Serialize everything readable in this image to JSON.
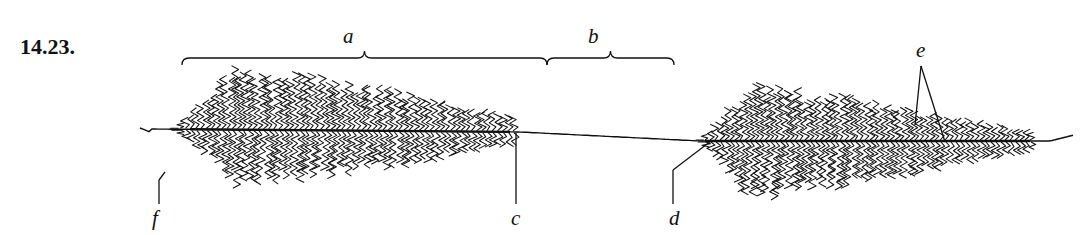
{
  "figure": {
    "number": "14.23.",
    "labels": {
      "a": "a",
      "b": "b",
      "c": "c",
      "d": "d",
      "e": "e",
      "f": "f"
    },
    "colors": {
      "ink": "#111111",
      "background": "#ffffff"
    }
  },
  "layout": {
    "axis": {
      "y_left": 129,
      "y_right": 141
    },
    "left_fiber": {
      "x_start": 175,
      "x_end": 515,
      "max_up": 70,
      "max_down": 60,
      "spacing": 5.2
    },
    "right_fiber": {
      "x_start": 700,
      "x_end": 1030,
      "max_up": 62,
      "max_down": 62,
      "spacing": 5.0
    },
    "brace_a": {
      "x1": 182,
      "x2": 547,
      "y": 58
    },
    "brace_b": {
      "x1": 547,
      "x2": 674,
      "y": 58
    },
    "pointer_c": {
      "x": 516,
      "y1": 133,
      "y2": 204
    },
    "pointer_f": {
      "x": 159,
      "y1": 180,
      "y2": 204
    },
    "pointer_d": {
      "x_bottom": 673,
      "y_bottom": 204,
      "x_bend": 673,
      "y_bend": 170,
      "x_tip": 711,
      "y_tip": 141
    },
    "pointer_e": {
      "x_apex": 921,
      "y_apex": 66,
      "x_tip1": 915,
      "y_tip1": 125,
      "x_tip2": 945,
      "y_tip2": 142
    }
  }
}
